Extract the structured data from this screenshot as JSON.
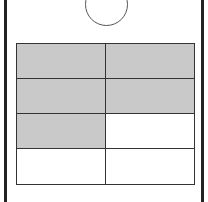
{
  "diagram": {
    "hole": {
      "shape": "circle"
    },
    "grid": {
      "rows": 4,
      "cols": 2,
      "cells": [
        [
          {
            "shaded": true
          },
          {
            "shaded": true
          }
        ],
        [
          {
            "shaded": true
          },
          {
            "shaded": true
          }
        ],
        [
          {
            "shaded": true
          },
          {
            "shaded": false
          }
        ],
        [
          {
            "shaded": false
          },
          {
            "shaded": false
          }
        ]
      ],
      "shaded_count": 5,
      "total_count": 8
    },
    "colors": {
      "shaded": "#c9c9c9",
      "unshaded": "#ffffff",
      "line": "#333333"
    }
  }
}
